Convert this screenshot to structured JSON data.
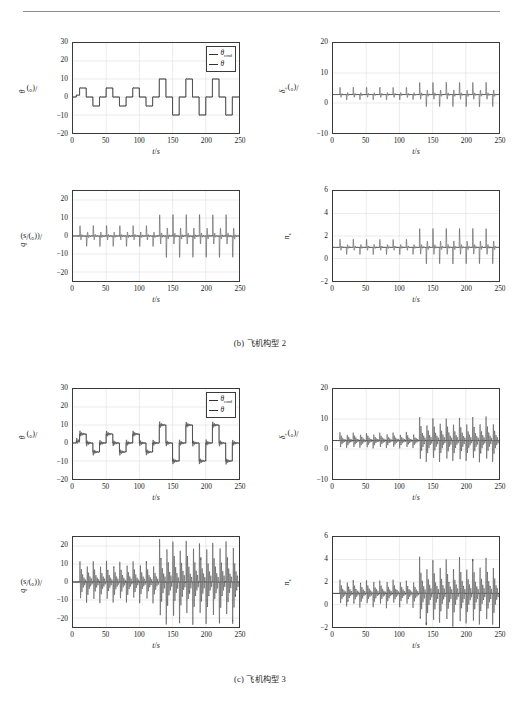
{
  "figure": {
    "panels": [
      {
        "id": "b",
        "caption_prefix": "(b)",
        "caption_cn": "飞机构型",
        "caption_num": "2"
      },
      {
        "id": "c",
        "caption_prefix": "(c)",
        "caption_cn": "飞机构型",
        "caption_num": "3"
      }
    ],
    "legend": {
      "items": [
        {
          "label": "θ",
          "sub": "cmd"
        },
        {
          "label": "θ",
          "sub": ""
        }
      ]
    },
    "axis_titles": {
      "time": "t",
      "time_unit": "s",
      "theta": "θ",
      "theta_unit": "(°)",
      "delta_e": "δ",
      "delta_e_sub": "e",
      "delta_e_unit": "(°)",
      "q": "q",
      "q_unit": "((°)/s)",
      "nz": "n",
      "nz_sub": "z"
    }
  },
  "chart_data": [
    {
      "id": "b-theta",
      "panel": "b",
      "position": "top-left",
      "type": "line",
      "title": "",
      "xlabel": "t/s",
      "ylabel": "θ/(°)",
      "xlim": [
        0,
        250
      ],
      "ylim": [
        -20,
        30
      ],
      "xticks": [
        0,
        50,
        100,
        150,
        200,
        250
      ],
      "yticks": [
        -20,
        -10,
        0,
        10,
        20,
        30
      ],
      "grid": true,
      "legend": [
        "θcmd",
        "θ"
      ],
      "legend_position": "top-right",
      "series": [
        {
          "name": "θcmd",
          "type": "step",
          "x": [
            0,
            5,
            10,
            20,
            30,
            40,
            50,
            60,
            70,
            80,
            90,
            100,
            110,
            120,
            130,
            140,
            150,
            160,
            170,
            180,
            190,
            200,
            210,
            220,
            230,
            240,
            250
          ],
          "values": [
            0,
            1,
            5,
            0,
            -5,
            0,
            5,
            0,
            -5,
            0,
            5,
            0,
            -5,
            0,
            10,
            0,
            -10,
            0,
            10,
            0,
            -10,
            0,
            10,
            0,
            -10,
            0,
            0
          ]
        },
        {
          "name": "θ",
          "type": "step-tracking",
          "x": [
            0,
            5,
            10,
            20,
            30,
            40,
            50,
            60,
            70,
            80,
            90,
            100,
            110,
            120,
            130,
            140,
            150,
            160,
            170,
            180,
            190,
            200,
            210,
            220,
            230,
            240,
            250
          ],
          "values": [
            0,
            1,
            5,
            0,
            -5,
            0,
            5,
            0,
            -5,
            0,
            5,
            0,
            -5,
            0,
            10,
            0,
            -10,
            0,
            10,
            0,
            -10,
            0,
            10,
            0,
            -10,
            0,
            0
          ]
        }
      ]
    },
    {
      "id": "b-deltae",
      "panel": "b",
      "position": "top-right",
      "type": "line",
      "xlabel": "t/s",
      "ylabel": "δe/(°)",
      "xlim": [
        0,
        250
      ],
      "ylim": [
        -10,
        20
      ],
      "xticks": [
        0,
        50,
        100,
        150,
        200,
        250
      ],
      "yticks": [
        -10,
        0,
        10,
        20
      ],
      "grid": true,
      "baseline": 2.8,
      "spike_times": [
        10,
        20,
        30,
        40,
        50,
        60,
        70,
        80,
        90,
        100,
        110,
        120,
        130,
        140,
        150,
        160,
        170,
        180,
        190,
        200,
        210,
        220,
        230,
        240
      ],
      "spike_peaks_early": 6.6,
      "spike_troughs_early": 0.1,
      "spike_peaks_late": 9.2,
      "spike_troughs_late": -3.5,
      "transition_time": 130
    },
    {
      "id": "b-q",
      "panel": "b",
      "position": "bottom-left",
      "type": "line",
      "xlabel": "t/s",
      "ylabel": "q/((°)/s)",
      "xlim": [
        0,
        250
      ],
      "ylim": [
        -25,
        25
      ],
      "xticks": [
        0,
        50,
        100,
        150,
        200,
        250
      ],
      "yticks": [
        -20,
        -10,
        0,
        10,
        20
      ],
      "grid": true,
      "baseline": 0,
      "spike_times": [
        10,
        20,
        30,
        40,
        50,
        60,
        70,
        80,
        90,
        100,
        110,
        120,
        130,
        140,
        150,
        160,
        170,
        180,
        190,
        200,
        210,
        220,
        230,
        240
      ],
      "spike_peaks_early": 9.0,
      "spike_troughs_early": -9.0,
      "spike_peaks_late": 18.5,
      "spike_troughs_late": -18.5,
      "transition_time": 130
    },
    {
      "id": "b-nz",
      "panel": "b",
      "position": "bottom-right",
      "type": "line",
      "xlabel": "t/s",
      "ylabel": "nz",
      "xlim": [
        0,
        250
      ],
      "ylim": [
        -2,
        6
      ],
      "xticks": [
        0,
        50,
        100,
        150,
        200,
        250
      ],
      "yticks": [
        -2,
        0,
        2,
        4,
        6
      ],
      "grid": true,
      "baseline": 1.0,
      "spike_times": [
        10,
        20,
        30,
        40,
        50,
        60,
        70,
        80,
        90,
        100,
        110,
        120,
        130,
        140,
        150,
        160,
        170,
        180,
        190,
        200,
        210,
        220,
        230,
        240
      ],
      "spike_peaks_early": 2.1,
      "spike_troughs_early": 0.0,
      "spike_peaks_late": 3.6,
      "spike_troughs_late": -1.3,
      "transition_time": 130
    },
    {
      "id": "c-theta",
      "panel": "c",
      "position": "top-left",
      "type": "line",
      "xlabel": "t/s",
      "ylabel": "θ/(°)",
      "xlim": [
        0,
        250
      ],
      "ylim": [
        -20,
        30
      ],
      "xticks": [
        0,
        50,
        100,
        150,
        200,
        250
      ],
      "yticks": [
        -20,
        -10,
        0,
        10,
        20,
        30
      ],
      "grid": true,
      "legend": [
        "θcmd",
        "θ"
      ],
      "legend_position": "top-right",
      "oscillatory": true,
      "overshoot_early": 1.8,
      "overshoot_late": 3.2,
      "series": [
        {
          "name": "θcmd",
          "type": "step",
          "x": [
            0,
            5,
            10,
            20,
            30,
            40,
            50,
            60,
            70,
            80,
            90,
            100,
            110,
            120,
            130,
            140,
            150,
            160,
            170,
            180,
            190,
            200,
            210,
            220,
            230,
            240,
            250
          ],
          "values": [
            0,
            1,
            5,
            0,
            -5,
            0,
            5,
            0,
            -5,
            0,
            5,
            0,
            -5,
            0,
            10,
            0,
            -10,
            0,
            10,
            0,
            -10,
            0,
            10,
            0,
            -10,
            0,
            0
          ]
        },
        {
          "name": "θ",
          "type": "step-tracking-oscillatory",
          "x": [
            0,
            5,
            10,
            20,
            30,
            40,
            50,
            60,
            70,
            80,
            90,
            100,
            110,
            120,
            130,
            140,
            150,
            160,
            170,
            180,
            190,
            200,
            210,
            220,
            230,
            240,
            250
          ],
          "values": [
            0,
            1,
            5,
            0,
            -5,
            0,
            5,
            0,
            -5,
            0,
            5,
            0,
            -5,
            0,
            10,
            0,
            -10,
            0,
            10,
            0,
            -10,
            0,
            10,
            0,
            -10,
            0,
            0
          ]
        }
      ]
    },
    {
      "id": "c-deltae",
      "panel": "c",
      "position": "top-right",
      "type": "line",
      "xlabel": "t/s",
      "ylabel": "δe/(°)",
      "xlim": [
        0,
        250
      ],
      "ylim": [
        -10,
        20
      ],
      "xticks": [
        0,
        50,
        100,
        150,
        200,
        250
      ],
      "yticks": [
        -10,
        0,
        10,
        20
      ],
      "grid": true,
      "baseline": 2.8,
      "spike_times": [
        10,
        20,
        30,
        40,
        50,
        60,
        70,
        80,
        90,
        100,
        110,
        120,
        130,
        140,
        150,
        160,
        170,
        180,
        190,
        200,
        210,
        220,
        230,
        240
      ],
      "spike_peaks_early": 5.6,
      "spike_troughs_early": 0.2,
      "spike_peaks_late": 10.8,
      "spike_troughs_late": -4.5,
      "transition_time": 130,
      "oscillatory": true
    },
    {
      "id": "c-q",
      "panel": "c",
      "position": "bottom-left",
      "type": "line",
      "xlabel": "t/s",
      "ylabel": "q/((°)/s)",
      "xlim": [
        0,
        250
      ],
      "ylim": [
        -25,
        25
      ],
      "xticks": [
        0,
        50,
        100,
        150,
        200,
        250
      ],
      "yticks": [
        -20,
        -10,
        0,
        10,
        20
      ],
      "grid": true,
      "baseline": 0,
      "spike_times": [
        10,
        20,
        30,
        40,
        50,
        60,
        70,
        80,
        90,
        100,
        110,
        120,
        130,
        140,
        150,
        160,
        170,
        180,
        190,
        200,
        210,
        220,
        230,
        240
      ],
      "spike_peaks_early": 12.0,
      "spike_troughs_early": -12.0,
      "spike_peaks_late": 24.0,
      "spike_troughs_late": -24.0,
      "transition_time": 130,
      "oscillatory": true
    },
    {
      "id": "c-nz",
      "panel": "c",
      "position": "bottom-right",
      "type": "line",
      "xlabel": "t/s",
      "ylabel": "nz",
      "xlim": [
        0,
        250
      ],
      "ylim": [
        -2,
        6
      ],
      "xticks": [
        0,
        50,
        100,
        150,
        200,
        250
      ],
      "yticks": [
        -2,
        0,
        2,
        4,
        6
      ],
      "grid": true,
      "baseline": 1.0,
      "spike_times": [
        10,
        20,
        30,
        40,
        50,
        60,
        70,
        80,
        90,
        100,
        110,
        120,
        130,
        140,
        150,
        160,
        170,
        180,
        190,
        200,
        210,
        220,
        230,
        240
      ],
      "spike_peaks_early": 2.2,
      "spike_troughs_early": -0.3,
      "spike_peaks_late": 4.2,
      "spike_troughs_late": -1.9,
      "transition_time": 130,
      "oscillatory": true
    }
  ]
}
